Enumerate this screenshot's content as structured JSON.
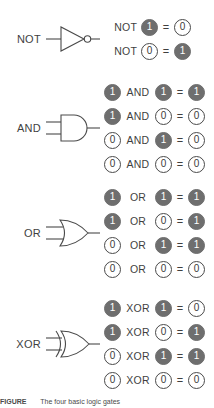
{
  "figure": {
    "caption_label": "FIGURE",
    "caption_text": "The four basic logic gates"
  },
  "colors": {
    "bit_on_fill": "#6e6e6e",
    "bit_on_text": "#ffffff",
    "bit_off_fill": "#ffffff",
    "bit_off_stroke": "#4a4a4a",
    "bit_off_text": "#3a3a3a",
    "line": "#4a4a4a",
    "text": "#3f3f3f",
    "background": "#ffffff"
  },
  "equals_sign": "=",
  "gates": [
    {
      "name": "NOT",
      "label": "NOT",
      "symbol_icon": "not-gate-icon",
      "arity": "unary",
      "rows": [
        {
          "op": "NOT",
          "a": "1",
          "a_on": true,
          "result": "0",
          "result_on": false
        },
        {
          "op": "NOT",
          "a": "0",
          "a_on": false,
          "result": "1",
          "result_on": true
        }
      ]
    },
    {
      "name": "AND",
      "label": "AND",
      "symbol_icon": "and-gate-icon",
      "arity": "binary",
      "rows": [
        {
          "a": "1",
          "a_on": true,
          "op": "AND",
          "b": "1",
          "b_on": true,
          "result": "1",
          "result_on": true
        },
        {
          "a": "1",
          "a_on": true,
          "op": "AND",
          "b": "0",
          "b_on": false,
          "result": "0",
          "result_on": false
        },
        {
          "a": "0",
          "a_on": false,
          "op": "AND",
          "b": "1",
          "b_on": true,
          "result": "0",
          "result_on": false
        },
        {
          "a": "0",
          "a_on": false,
          "op": "AND",
          "b": "0",
          "b_on": false,
          "result": "0",
          "result_on": false
        }
      ]
    },
    {
      "name": "OR",
      "label": "OR",
      "symbol_icon": "or-gate-icon",
      "arity": "binary",
      "rows": [
        {
          "a": "1",
          "a_on": true,
          "op": "OR",
          "b": "1",
          "b_on": true,
          "result": "1",
          "result_on": true
        },
        {
          "a": "1",
          "a_on": true,
          "op": "OR",
          "b": "0",
          "b_on": false,
          "result": "1",
          "result_on": true
        },
        {
          "a": "0",
          "a_on": false,
          "op": "OR",
          "b": "1",
          "b_on": true,
          "result": "1",
          "result_on": true
        },
        {
          "a": "0",
          "a_on": false,
          "op": "OR",
          "b": "0",
          "b_on": false,
          "result": "0",
          "result_on": false
        }
      ]
    },
    {
      "name": "XOR",
      "label": "XOR",
      "symbol_icon": "xor-gate-icon",
      "arity": "binary",
      "rows": [
        {
          "a": "1",
          "a_on": true,
          "op": "XOR",
          "b": "1",
          "b_on": true,
          "result": "0",
          "result_on": false
        },
        {
          "a": "1",
          "a_on": true,
          "op": "XOR",
          "b": "0",
          "b_on": false,
          "result": "1",
          "result_on": true
        },
        {
          "a": "0",
          "a_on": false,
          "op": "XOR",
          "b": "1",
          "b_on": true,
          "result": "1",
          "result_on": true
        },
        {
          "a": "0",
          "a_on": false,
          "op": "XOR",
          "b": "0",
          "b_on": false,
          "result": "0",
          "result_on": false
        }
      ]
    }
  ]
}
